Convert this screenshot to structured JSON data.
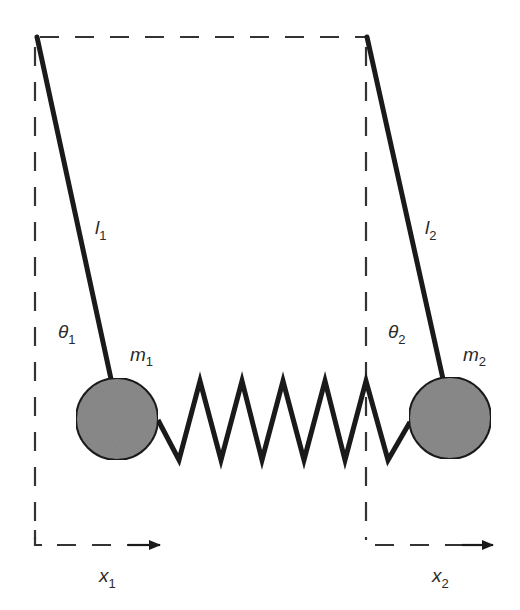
{
  "diagram": {
    "type": "coupled-pendulums-with-spring",
    "colors": {
      "line": "#1a1a1a",
      "dash": "#333333",
      "mass_fill": "#8a8a8a",
      "mass_stroke": "#1a1a1a",
      "text": "#2a2a2a",
      "background": "#ffffff"
    },
    "labels": {
      "l1": {
        "base": "l",
        "sub": "1"
      },
      "l2": {
        "base": "l",
        "sub": "2"
      },
      "theta1": {
        "base": "θ",
        "sub": "1"
      },
      "theta2": {
        "base": "θ",
        "sub": "2"
      },
      "m1": {
        "base": "m",
        "sub": "1"
      },
      "m2": {
        "base": "m",
        "sub": "2"
      },
      "x1": {
        "base": "x",
        "sub": "1"
      },
      "x2": {
        "base": "x",
        "sub": "2"
      }
    },
    "nodes": [
      {
        "id": "pivot1",
        "label": "",
        "x": 36,
        "y": 37
      },
      {
        "id": "pivot2",
        "label": "",
        "x": 366,
        "y": 37
      },
      {
        "id": "mass1",
        "label": "m1",
        "x": 117,
        "y": 419
      },
      {
        "id": "mass2",
        "label": "m2",
        "x": 450,
        "y": 418
      }
    ],
    "edges": [
      {
        "from": "pivot1",
        "to": "mass1",
        "label": "l1",
        "kind": "rod"
      },
      {
        "from": "pivot2",
        "to": "mass2",
        "label": "l2",
        "kind": "rod"
      },
      {
        "from": "mass1",
        "to": "mass2",
        "label": "",
        "kind": "spring"
      },
      {
        "from": "pivot1",
        "to": "pivot2",
        "label": "",
        "kind": "dashed-reference"
      }
    ],
    "axes": [
      {
        "name": "x1",
        "direction": "right"
      },
      {
        "name": "x2",
        "direction": "right"
      }
    ],
    "angles": [
      {
        "name": "theta1",
        "between": [
          "vertical-reference-1",
          "rod-1"
        ]
      },
      {
        "name": "theta2",
        "between": [
          "vertical-reference-2",
          "rod-2"
        ]
      }
    ]
  }
}
